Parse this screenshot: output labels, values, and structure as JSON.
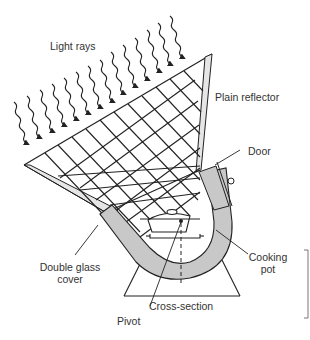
{
  "diagram": {
    "labels": {
      "light_rays": "Light rays",
      "plain_reflector": "Plain reflector",
      "door": "Door",
      "cooking_pot_line1": "Cooking",
      "cooking_pot_line2": "pot",
      "double_glass_line1": "Double glass",
      "double_glass_line2": "cover",
      "cross_section": "Cross-section",
      "pivot": "Pivot"
    },
    "colors": {
      "line": "#222222",
      "fill_grey": "#c8c8c8",
      "reflector_fill": "#e6e6e6",
      "text": "#333333",
      "background": "#ffffff"
    }
  }
}
